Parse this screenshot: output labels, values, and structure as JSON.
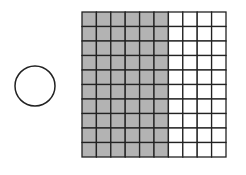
{
  "diagram": {
    "circle": {
      "cx": 35,
      "cy": 86,
      "r": 20,
      "stroke": "#222222",
      "fill": "#ffffff"
    },
    "grid": {
      "x": 82,
      "y": 12,
      "width": 144,
      "height": 145,
      "rows": 10,
      "cols": 10,
      "shaded_cols": 6,
      "shaded_cells": 60,
      "total_cells": 100,
      "shade_color": "#b3b3b3",
      "line_color": "#222222"
    }
  }
}
